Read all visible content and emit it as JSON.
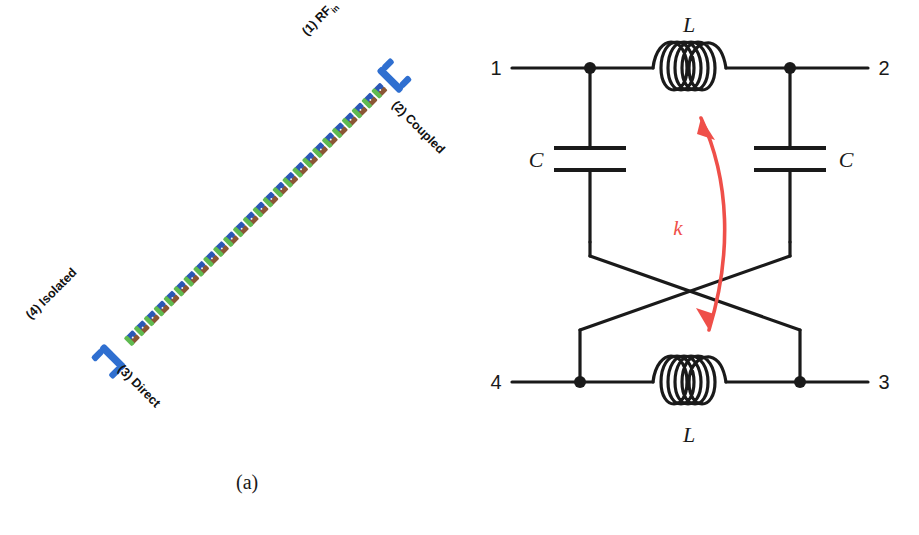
{
  "figure": {
    "panels": [
      {
        "id": "a",
        "caption": "(a)",
        "type": "coupled-line-layout",
        "ports": [
          {
            "id": "p1",
            "number": "(1)",
            "name": "RF",
            "subscript": "in",
            "full": "(1) RF"
          },
          {
            "id": "p2",
            "number": "(2)",
            "name": "Coupled",
            "subscript": "",
            "full": "(2) Coupled"
          },
          {
            "id": "p3",
            "number": "(3)",
            "name": "Direct",
            "subscript": "",
            "full": "(3) Direct"
          },
          {
            "id": "p4",
            "number": "(4)",
            "name": "Isolated",
            "subscript": "",
            "full": "(4) Isolated"
          }
        ],
        "colors": {
          "conductor_blue": "#2b57b5",
          "conductor_green": "#5fba50",
          "conductor_brown": "#8a5534",
          "terminal_blue": "#2f6fd0",
          "via_white": "#f3f3f3"
        },
        "unit_cells": 26
      },
      {
        "id": "b",
        "caption": "(b)",
        "type": "lumped-equivalent-circuit",
        "port_labels": {
          "top_left": "1",
          "top_right": "2",
          "bottom_right": "3",
          "bottom_left": "4"
        },
        "components": {
          "inductor_top": "L",
          "inductor_bottom": "L",
          "capacitor_left": "C",
          "capacitor_right": "C",
          "coupling": "k"
        },
        "colors": {
          "wire": "#1a1a1a",
          "coupling_arrow": "#ef4f49"
        },
        "inductor_turns": 5
      }
    ]
  }
}
